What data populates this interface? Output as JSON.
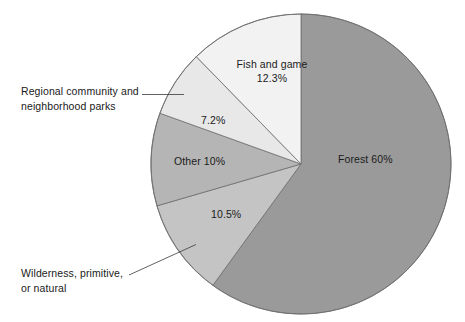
{
  "figure": {
    "background_color": "#ffffff",
    "width": 465,
    "height": 322
  },
  "chart_data": {
    "type": "pie",
    "title": "",
    "subtitle": "",
    "xlabel": "",
    "ylabel": "",
    "grid": false,
    "legend_position": "none",
    "total_percent": 100,
    "start_angle_deg": 0,
    "direction": "clockwise",
    "center": {
      "x": 301,
      "y": 164
    },
    "radius": 150,
    "categories": [
      "Forest",
      "Wilderness, primitive, or natural",
      "Other",
      "Regional community and neighborhood parks",
      "Fish and game"
    ],
    "values": [
      60,
      10.5,
      10,
      7.2,
      12.3
    ],
    "colors": [
      "#9a9a9a",
      "#c4c4c4",
      "#b5b5b5",
      "#e8e8e8",
      "#f2f2f2"
    ],
    "slices": [
      {
        "name": "forest",
        "label": "Forest 60%",
        "value": 60,
        "value_text": "60%",
        "color": "#9a9a9a",
        "start_deg": 0,
        "end_deg": 216,
        "label_placement": "inside"
      },
      {
        "name": "wilderness-primitive-or-natural",
        "label": "Wilderness, primitive, or natural",
        "value": 10.5,
        "value_text": "10.5%",
        "color": "#c4c4c4",
        "start_deg": 216,
        "end_deg": 253.8,
        "label_placement": "outside-leader"
      },
      {
        "name": "other",
        "label": "Other 10%",
        "value": 10,
        "value_text": "10%",
        "color": "#b5b5b5",
        "start_deg": 253.8,
        "end_deg": 289.8,
        "label_placement": "inside"
      },
      {
        "name": "regional-community-and-neighborhood-parks",
        "label": "Regional community and neighborhood parks",
        "value": 7.2,
        "value_text": "7.2%",
        "color": "#e8e8e8",
        "start_deg": 289.8,
        "end_deg": 315.72,
        "label_placement": "outside-leader"
      },
      {
        "name": "fish-and-game",
        "label": "Fish and game",
        "value": 12.3,
        "value_text": "12.3%",
        "color": "#f2f2f2",
        "start_deg": 315.72,
        "end_deg": 360,
        "label_placement": "inside"
      }
    ]
  },
  "labels": {
    "forest": "Forest 60%",
    "fish_and_game_name": "Fish and game",
    "fish_and_game_value": "12.3%",
    "other": "Other 10%",
    "regional_value": "7.2%",
    "wilderness_value": "10.5%",
    "regional_line1": "Regional community and",
    "regional_line2": "neighborhood parks",
    "wilderness_line1": "Wilderness, primitive,",
    "wilderness_line2": "or natural"
  }
}
